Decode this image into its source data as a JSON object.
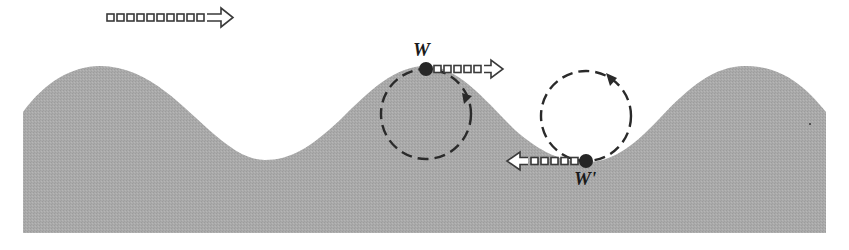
{
  "figure": {
    "colors": {
      "water": "#a9a9a9",
      "background": "#ffffff",
      "ink": "#2a2a2a"
    },
    "wave": {
      "left": 23,
      "right": 826,
      "bottom": 233,
      "crests": [
        {
          "x": 100,
          "y": 66
        },
        {
          "x": 426,
          "y": 66
        },
        {
          "x": 745,
          "y": 66
        }
      ],
      "troughs": [
        {
          "x": 265,
          "y": 160
        },
        {
          "x": 586,
          "y": 162
        }
      ]
    },
    "propagation_arrow": {
      "direction": "right",
      "x": 107,
      "y": 19,
      "squares": 10
    },
    "orbits": [
      {
        "name": "crest-orbit",
        "cx": 426,
        "cy": 114,
        "r": 45,
        "direction": "clockwise",
        "particle": {
          "label": "W",
          "x": 426,
          "y": 69,
          "label_x": 413,
          "label_y": 41
        },
        "velocity_arrow": {
          "direction": "right",
          "x": 432,
          "y": 69,
          "squares": 5
        }
      },
      {
        "name": "trough-orbit",
        "cx": 586,
        "cy": 116,
        "r": 45,
        "direction": "clockwise",
        "particle": {
          "label": "W'",
          "x": 586,
          "y": 161,
          "label_x": 574,
          "label_y": 170
        },
        "velocity_arrow": {
          "direction": "left",
          "x": 505,
          "y": 161,
          "squares": 5
        }
      }
    ]
  }
}
